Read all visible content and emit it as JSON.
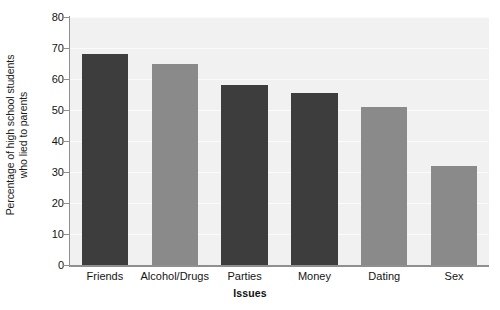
{
  "chart_data": {
    "type": "bar",
    "title": "",
    "subtitle": "",
    "xlabel": "Issues",
    "ylabel": "Percentage of high school students who lied to parents",
    "ylabel_line1": "Percentage of high school students",
    "ylabel_line2": "who lied to parents",
    "categories": [
      "Friends",
      "Alcohol/Drugs",
      "Parties",
      "Money",
      "Dating",
      "Sex"
    ],
    "values": [
      68,
      65,
      58,
      55.5,
      51,
      32
    ],
    "bar_colors": [
      "#3d3d3d",
      "#8a8a8a",
      "#3d3d3d",
      "#3d3d3d",
      "#8a8a8a",
      "#8a8a8a"
    ],
    "ylim": [
      0,
      80
    ],
    "ytick_values": [
      0,
      10,
      20,
      30,
      40,
      50,
      60,
      70,
      80
    ],
    "ytick_labels": [
      "0",
      "10",
      "20",
      "30",
      "40",
      "50",
      "60",
      "70",
      "80"
    ],
    "grid": true,
    "grid_color": "#fbfbfb",
    "plot_background": "#f1f1f1",
    "axis_color": "#8f8f8f",
    "legend": null,
    "legend_position": "none",
    "annotations": []
  }
}
